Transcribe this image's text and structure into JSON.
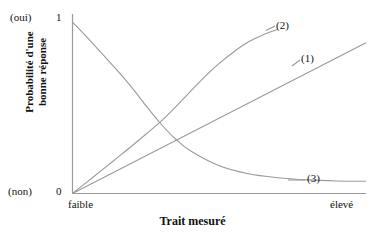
{
  "chart_data": {
    "type": "line",
    "title": "",
    "subtitle": "",
    "xlabel": "Trait mesuré",
    "ylabel": "Probabilité d'une bonne réponse",
    "ylabel_lines": [
      "Probabilité d'une",
      "bonne réponse"
    ],
    "grid": false,
    "legend_position": "inline-right-end-labels",
    "xlim": [
      0,
      1
    ],
    "ylim": [
      0,
      1
    ],
    "x_tick_labels": [
      "faible",
      "élevé"
    ],
    "y_tick_labels": [
      "0",
      "1"
    ],
    "y_tick_annotations": [
      "(non)",
      "(oui)"
    ],
    "y_axis_top_label": "1",
    "y_axis_bottom_label": "0",
    "y_axis_top_annotation": "(oui)",
    "y_axis_bottom_annotation": "(non)",
    "x_axis_left_label": "faible",
    "x_axis_right_label": "élevé",
    "line_color": "#9a9a9a",
    "axis_color": "#9a9a9a",
    "text_color": "#121212",
    "background_color": "#ffffff",
    "series": [
      {
        "name": "(1)",
        "label": "(1)",
        "shape": "linear",
        "description": "Droite croissante linéaire",
        "x": [
          0.0,
          0.1,
          0.2,
          0.3,
          0.4,
          0.5,
          0.6,
          0.7,
          0.8,
          0.9,
          1.0
        ],
        "values": [
          0.0,
          0.084,
          0.168,
          0.252,
          0.336,
          0.42,
          0.504,
          0.588,
          0.672,
          0.756,
          0.84
        ]
      },
      {
        "name": "(2)",
        "label": "(2)",
        "shape": "sigmoid",
        "description": "Courbe en ogive croissante (saturation haute)",
        "x": [
          0.0,
          0.05,
          0.1,
          0.15,
          0.2,
          0.25,
          0.3,
          0.35,
          0.4,
          0.45,
          0.5,
          0.55,
          0.6,
          0.65,
          0.7
        ],
        "values": [
          0.0,
          0.065,
          0.13,
          0.196,
          0.262,
          0.33,
          0.4,
          0.48,
          0.565,
          0.65,
          0.725,
          0.79,
          0.845,
          0.885,
          0.915
        ]
      },
      {
        "name": "(3)",
        "label": "(3)",
        "shape": "decreasing-exponential",
        "description": "Courbe décroissante tendant vers une asymptote basse",
        "x": [
          0.0,
          0.05,
          0.1,
          0.15,
          0.2,
          0.25,
          0.3,
          0.35,
          0.4,
          0.5,
          0.6,
          0.7,
          0.8,
          0.9,
          1.0
        ],
        "values": [
          0.955,
          0.87,
          0.78,
          0.69,
          0.595,
          0.49,
          0.39,
          0.305,
          0.24,
          0.155,
          0.11,
          0.088,
          0.076,
          0.07,
          0.068
        ]
      }
    ],
    "annotations": [
      {
        "text": "(1)",
        "x": 1.02,
        "y": 0.78
      },
      {
        "text": "(2)",
        "x": 0.92,
        "y": 0.96
      },
      {
        "text": "(3)",
        "x": 1.04,
        "y": 0.12
      }
    ],
    "intersection_note": "Les trois courbes se croisent vers x≈0.31, y≈0.32"
  }
}
